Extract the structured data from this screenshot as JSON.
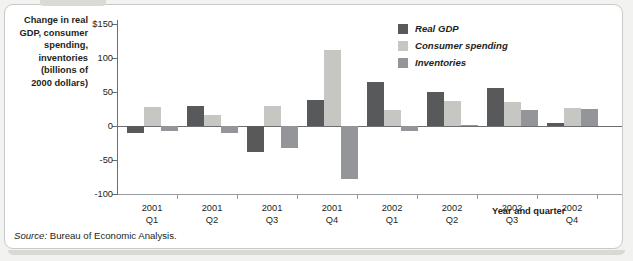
{
  "figure": {
    "y_axis_title": "Change in real GDP, consumer spending, inventories (billions of 2000 dollars)",
    "y_axis_title_lines": [
      "Change in real",
      "GDP, consumer",
      "spending,",
      "inventories",
      "(billions of",
      "2000 dollars)"
    ],
    "x_axis_title": "Year and quarter",
    "source_prefix": "Source:",
    "source_text": "Bureau of Economic Analysis."
  },
  "colors": {
    "real_gdp": "#58595b",
    "consumer_spending": "#c6c7c3",
    "inventories": "#939598",
    "axis": "#6d6e71",
    "text": "#231f20",
    "card_background": "#ffffff",
    "page_background": "#f2f2f0"
  },
  "legend": {
    "items": [
      {
        "label": "Real GDP",
        "color": "#58595b"
      },
      {
        "label": "Consumer spending",
        "color": "#c6c7c3"
      },
      {
        "label": "Inventories",
        "color": "#939598"
      }
    ]
  },
  "chart_data": {
    "type": "bar",
    "title": "",
    "xlabel": "Year and quarter",
    "ylabel": "Change in real GDP, consumer spending, inventories (billions of 2000 dollars)",
    "ylim": [
      -100,
      150
    ],
    "yticks": [
      150,
      100,
      50,
      0,
      -50,
      -100
    ],
    "ytick_labels": [
      "$150",
      "100",
      "50",
      "0",
      "-50",
      "-100"
    ],
    "grid": false,
    "legend_position": "top-right",
    "categories": [
      "2001 Q1",
      "2001 Q2",
      "2001 Q3",
      "2001 Q4",
      "2002 Q1",
      "2002 Q2",
      "2002 Q3",
      "2002 Q4"
    ],
    "category_lines": [
      [
        "2001",
        "Q1"
      ],
      [
        "2001",
        "Q2"
      ],
      [
        "2001",
        "Q3"
      ],
      [
        "2001",
        "Q4"
      ],
      [
        "2002",
        "Q1"
      ],
      [
        "2002",
        "Q2"
      ],
      [
        "2002",
        "Q3"
      ],
      [
        "2002",
        "Q4"
      ]
    ],
    "series": [
      {
        "name": "Real GDP",
        "color": "#58595b",
        "values": [
          -10,
          30,
          -38,
          38,
          65,
          50,
          56,
          4
        ]
      },
      {
        "name": "Consumer spending",
        "color": "#c6c7c3",
        "values": [
          28,
          16,
          29,
          112,
          23,
          37,
          36,
          26
        ]
      },
      {
        "name": "Inventories",
        "color": "#939598",
        "values": [
          -8,
          -10,
          -32,
          -78,
          -8,
          2,
          23,
          25
        ]
      }
    ]
  }
}
